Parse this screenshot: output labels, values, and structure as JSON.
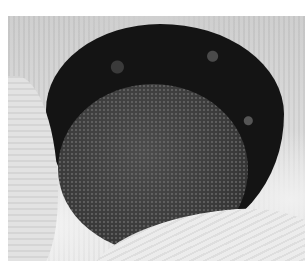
{
  "image": {
    "subject": "interior of a knitted bag with dark lining and textured circular bottom",
    "palette": {
      "background": "#ffffff",
      "knit_light": "#e4e4e4",
      "lining_dark": "#141414",
      "bottom_gray": "#3a3a3a"
    }
  }
}
